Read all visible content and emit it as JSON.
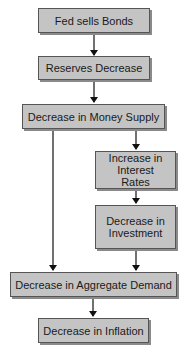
{
  "diagram": {
    "type": "flowchart",
    "nodes": [
      {
        "id": "n1",
        "label": "Fed sells Bonds"
      },
      {
        "id": "n2",
        "label": "Reserves Decrease"
      },
      {
        "id": "n3",
        "label": "Decrease in Money Supply"
      },
      {
        "id": "n4",
        "label": "Increase in Interest Rates"
      },
      {
        "id": "n5",
        "label": "Decrease in Investment"
      },
      {
        "id": "n6",
        "label": "Decrease in Aggregate Demand"
      },
      {
        "id": "n7",
        "label": "Decrease in Inflation"
      }
    ],
    "edges": [
      {
        "from": "n1",
        "to": "n2"
      },
      {
        "from": "n2",
        "to": "n3"
      },
      {
        "from": "n3",
        "to": "n4"
      },
      {
        "from": "n4",
        "to": "n5"
      },
      {
        "from": "n3",
        "to": "n6"
      },
      {
        "from": "n5",
        "to": "n6"
      },
      {
        "from": "n6",
        "to": "n7"
      }
    ],
    "colors": {
      "box_fill": "#c4c4c4",
      "box_border": "#555555",
      "arrow": "#111111"
    }
  }
}
